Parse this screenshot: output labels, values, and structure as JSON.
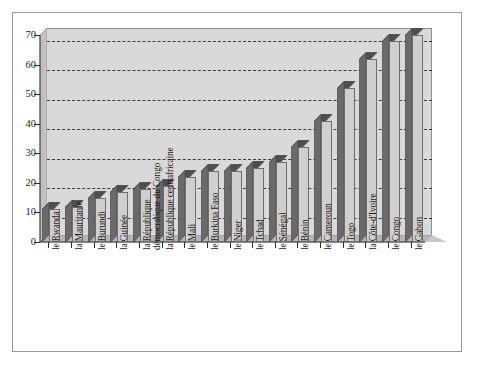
{
  "chart_data": {
    "type": "bar",
    "title": "",
    "subtitle": "",
    "xlabel": "",
    "ylabel": "",
    "ylim": [
      0,
      73
    ],
    "yticks": [
      0,
      10,
      20,
      30,
      40,
      50,
      60,
      70
    ],
    "ytick_labels": [
      "0",
      "10",
      "20",
      "30",
      "40",
      "50",
      "60",
      "70"
    ],
    "grid": "horizontal-dashed",
    "legend": "none",
    "style": "3d-column-grayscale",
    "categories": [
      "le Rwanda",
      "la Mauritanie",
      "le Burundi",
      "la Guinée",
      "la République démocratique du Congo",
      "la République centrafricaine",
      "le Mali",
      "le Burkina Faso",
      "le Niger",
      "le Tchad",
      "le Sénégal",
      "le Bénin",
      "le Cameroun",
      "le Togo",
      "la Côte-d'Ivoire",
      "le Congo",
      "le Gabon"
    ],
    "category_lines": [
      [
        "le Rwanda"
      ],
      [
        "la Mauritanie"
      ],
      [
        "le Burundi"
      ],
      [
        "la Guinée"
      ],
      [
        "la République",
        "démocratique du Congo"
      ],
      [
        "la République centrafricaine"
      ],
      [
        "le Mali"
      ],
      [
        "le Burkina Faso"
      ],
      [
        "le Niger"
      ],
      [
        "le Tchad"
      ],
      [
        "le Sénégal"
      ],
      [
        "le Bénin"
      ],
      [
        "le Cameroun"
      ],
      [
        "le Togo"
      ],
      [
        "la Côte-d'Ivoire"
      ],
      [
        "le Congo"
      ],
      [
        "le Gabon"
      ]
    ],
    "values": [
      11,
      12,
      15,
      17,
      18,
      19,
      22,
      24,
      24,
      25,
      27,
      32,
      41,
      52,
      62,
      68,
      70
    ],
    "colors": {
      "bar_front": "#cfcfcf",
      "bar_side": "#6a6a6a",
      "bar_top": "#4e4e4e",
      "bar_outline": "#6e6e6e",
      "plot_background": "#d9d9d9",
      "floor": "#b5b5b5",
      "gridline": "#3a3a3a",
      "axis": "#2a2a2a",
      "frame_border": "#9a9a9a",
      "page_background": "#ffffff",
      "text": "#1a1a1a"
    }
  }
}
